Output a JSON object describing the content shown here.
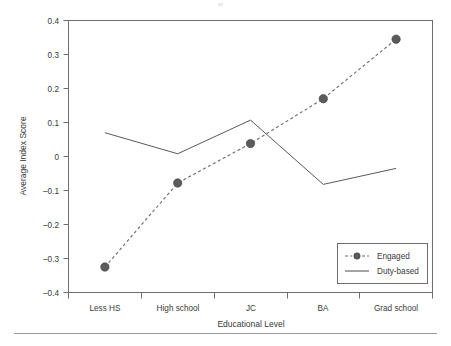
{
  "chart_data": {
    "type": "line",
    "title": "",
    "xlabel": "Educational Level",
    "ylabel": "Average Index Score",
    "categories": [
      "Less HS",
      "High school",
      "JC",
      "BA",
      "Grad school"
    ],
    "ylim": [
      -0.4,
      0.4
    ],
    "ytick_labels": [
      "0.4",
      "0.3",
      "0.2",
      "0.1",
      "0",
      "–0.1",
      "–0.2",
      "–0.3",
      "–0.4"
    ],
    "ytick_values": [
      0.4,
      0.3,
      0.2,
      0.1,
      0,
      -0.1,
      -0.2,
      -0.3,
      -0.4
    ],
    "grid": false,
    "legend_position": "bottom-right",
    "series": [
      {
        "name": "Engaged",
        "style": "dashed-with-markers",
        "color": "#5b5b5b",
        "values": [
          -0.325,
          -0.078,
          0.038,
          0.17,
          0.345
        ]
      },
      {
        "name": "Duty-based",
        "style": "solid",
        "color": "#5a5a5a",
        "values": [
          0.07,
          0.008,
          0.107,
          -0.082,
          -0.035
        ]
      }
    ]
  },
  "legend": {
    "items": [
      {
        "label": "Engaged",
        "marker": "dashed-circle-marker"
      },
      {
        "label": "Duty-based",
        "marker": "solid-line-marker"
      }
    ]
  },
  "colors": {
    "frame": "#6e6e6e",
    "text": "#3a3a3a",
    "engaged": "#5b5b5b",
    "duty_based": "#5a5a5a",
    "rule": "#9a9a9a"
  }
}
